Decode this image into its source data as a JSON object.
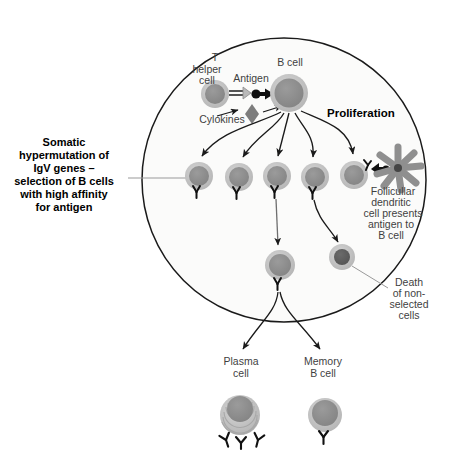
{
  "figure": {
    "title_visible": false,
    "background_color": "#ffffff",
    "germinal_center": {
      "name": "germinal-center-boundary",
      "shape": "circle",
      "cx": 284,
      "cy": 180,
      "r": 142,
      "fill": "#fbfbfa",
      "stroke": "#1a1a1a"
    }
  },
  "palette": {
    "cell_cytoplasm": "#bdbdbd",
    "cell_nucleus": "#8d8d8d",
    "dead_cell_nucleus": "#5d5d5d",
    "dendritic_cell": "#8f8f8f",
    "antigen": "#111111",
    "cytokine": "#7d7d7d",
    "antibody": "#111111",
    "arrow": "#1a1a1a",
    "leader_line": "#9a9a9a",
    "label_text": "#3f3f3f",
    "bold_text": "#000000"
  },
  "labels": {
    "t_helper_cell": [
      "T",
      "helper",
      "cell"
    ],
    "b_cell": "B cell",
    "antigen": "Antigen",
    "cytokines": "Cylokines",
    "proliferation": "Proliferation",
    "somatic_hypermutation": [
      "Somatic",
      "hypermutation of",
      "IgV genes –",
      "selection of B cells",
      "with high affinity",
      "for antigen"
    ],
    "follicular_dendritic": [
      "Follicullar",
      "dendritic",
      "cell presents",
      "antigen to",
      "B cell"
    ],
    "death_non_selected": [
      "Death",
      "of non-",
      "selected",
      "cells"
    ],
    "plasma_cell": [
      "Plasma",
      "cell"
    ],
    "memory_b_cell": [
      "Memory",
      "B cell"
    ]
  },
  "cells": {
    "t_helper": {
      "name": "t-helper-cell",
      "cx": 215,
      "cy": 94,
      "r_outer": 14,
      "r_inner": 10
    },
    "b_cell_parent": {
      "name": "b-cell",
      "cx": 289,
      "cy": 93,
      "r_outer": 19,
      "r_inner": 14
    },
    "selected_clone": {
      "name": "selected-b-cell",
      "cx": 280,
      "cy": 265,
      "r_outer": 15,
      "r_inner": 11
    },
    "dying_cell": {
      "name": "dying-b-cell",
      "cx": 342,
      "cy": 257,
      "r_outer": 13,
      "r_inner": 8
    },
    "plasma_cell": {
      "name": "plasma-cell",
      "cx": 240,
      "cy": 415,
      "r_outer": 20,
      "r_inner": 14,
      "er_rings": 7,
      "antibodies": 3
    },
    "memory_cell": {
      "name": "memory-b-cell",
      "cx": 325,
      "cy": 415,
      "r_outer": 17,
      "r_inner": 13,
      "antibodies": 1
    },
    "daughter_row": [
      {
        "name": "daughter-b-cell-1",
        "cx": 199,
        "cy": 176,
        "r_outer": 14,
        "r_inner": 10
      },
      {
        "name": "daughter-b-cell-2",
        "cx": 239,
        "cy": 177,
        "r_outer": 14,
        "r_inner": 10
      },
      {
        "name": "daughter-b-cell-3",
        "cx": 277,
        "cy": 176,
        "r_outer": 14,
        "r_inner": 10
      },
      {
        "name": "daughter-b-cell-4",
        "cx": 315,
        "cy": 177,
        "r_outer": 14,
        "r_inner": 10
      },
      {
        "name": "daughter-b-cell-5",
        "cx": 354,
        "cy": 175,
        "r_outer": 14,
        "r_inner": 10
      }
    ],
    "dendritic": {
      "name": "follicular-dendritic-cell",
      "cx": 398,
      "cy": 168,
      "arms": 8,
      "arm_len": 23,
      "core_r": 4
    }
  },
  "process_flow": {
    "steps": [
      "T helper cell delivers cytokines to B cell",
      "Antigen binds B cell receptor",
      "Proliferation into five daughter B cells",
      "Somatic hypermutation and affinity selection",
      "Follicular dendritic cell presents antigen to B cell",
      "Non-selected cells die",
      "Selected clone differentiates into plasma cell and memory B cell"
    ]
  }
}
